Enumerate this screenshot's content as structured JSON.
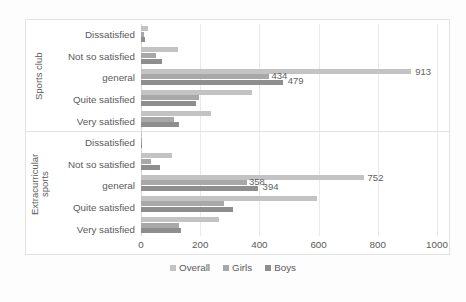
{
  "chart_data": {
    "type": "bar",
    "orientation": "horizontal",
    "title": "",
    "xlabel": "",
    "ylabel": "",
    "xlim": [
      0,
      1000
    ],
    "xticks": [
      "0",
      "200",
      "400",
      "600",
      "800",
      "1000"
    ],
    "grid": true,
    "legend_position": "bottom",
    "groups": [
      {
        "name": "Sports club",
        "categories": [
          "Dissatisfied",
          "Not so satisfied",
          "general",
          "Quite satisfied",
          "Very satisfied"
        ]
      },
      {
        "name": "Extracurricular sports",
        "categories": [
          "Dissatisfied",
          "Not so satisfied",
          "general",
          "Quite satisfied",
          "Very satisfied"
        ]
      }
    ],
    "series": [
      {
        "name": "Overall",
        "color": "#c3c3c3",
        "values": [
          25,
          125,
          913,
          375,
          235,
          5,
          105,
          752,
          595,
          265
        ]
      },
      {
        "name": "Girls",
        "color": "#a8a8a8",
        "values": [
          10,
          50,
          434,
          195,
          110,
          2,
          35,
          358,
          280,
          130
        ]
      },
      {
        "name": "Boys",
        "color": "#8e8e8e",
        "values": [
          15,
          70,
          479,
          185,
          130,
          3,
          65,
          394,
          310,
          135
        ]
      }
    ],
    "data_labels": [
      {
        "row": 2,
        "series": "Girls",
        "text": "434"
      },
      {
        "row": 2,
        "series": "Boys",
        "text": "479"
      },
      {
        "row": 2,
        "series": "Overall",
        "text": "913"
      },
      {
        "row": 7,
        "series": "Girls",
        "text": "358"
      },
      {
        "row": 7,
        "series": "Boys",
        "text": "394"
      },
      {
        "row": 7,
        "series": "Overall",
        "text": "752"
      }
    ],
    "rows": [
      {
        "group": "Sports club",
        "category": "Dissatisfied",
        "Overall": 25,
        "Girls": 10,
        "Boys": 15
      },
      {
        "group": "Sports club",
        "category": "Not so satisfied",
        "Overall": 125,
        "Girls": 50,
        "Boys": 70
      },
      {
        "group": "Sports club",
        "category": "general",
        "Overall": 913,
        "Girls": 434,
        "Boys": 479
      },
      {
        "group": "Sports club",
        "category": "Quite satisfied",
        "Overall": 375,
        "Girls": 195,
        "Boys": 185
      },
      {
        "group": "Sports club",
        "category": "Very satisfied",
        "Overall": 235,
        "Girls": 110,
        "Boys": 130
      },
      {
        "group": "Extracurricular sports",
        "category": "Dissatisfied",
        "Overall": 5,
        "Girls": 2,
        "Boys": 3
      },
      {
        "group": "Extracurricular sports",
        "category": "Not so satisfied",
        "Overall": 105,
        "Girls": 35,
        "Boys": 65
      },
      {
        "group": "Extracurricular sports",
        "category": "general",
        "Overall": 752,
        "Girls": 358,
        "Boys": 394
      },
      {
        "group": "Extracurricular sports",
        "category": "Quite satisfied",
        "Overall": 595,
        "Girls": 280,
        "Boys": 310
      },
      {
        "group": "Extracurricular sports",
        "category": "Very satisfied",
        "Overall": 265,
        "Girls": 130,
        "Boys": 135
      }
    ]
  },
  "axis": {
    "ticks": [
      "0",
      "200",
      "400",
      "600",
      "800",
      "1000"
    ]
  },
  "group_labels": {
    "sports_club": "Sports club",
    "extracurricular": "Extracurricular\nsports"
  },
  "categories": {
    "sports_club": [
      "Dissatisfied",
      "Not so satisfied",
      "general",
      "Quite satisfied",
      "Very satisfied"
    ],
    "extracurricular": [
      "Dissatisfied",
      "Not so satisfied",
      "general",
      "Quite satisfied",
      "Very satisfied"
    ]
  },
  "legend": {
    "items": [
      {
        "label": "Overall",
        "color": "#c3c3c3"
      },
      {
        "label": "Girls",
        "color": "#a8a8a8"
      },
      {
        "label": "Boys",
        "color": "#8e8e8e"
      }
    ]
  }
}
